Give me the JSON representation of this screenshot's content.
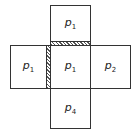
{
  "diagram": {
    "cells": {
      "top": {
        "base": "p",
        "sub": "1"
      },
      "left": {
        "base": "p",
        "sub": "1"
      },
      "center": {
        "base": "p",
        "sub": "1"
      },
      "right": {
        "base": "p",
        "sub": "2"
      },
      "bottom": {
        "base": "p",
        "sub": "4"
      }
    },
    "hatched_boundaries": [
      "top-center",
      "left-center"
    ],
    "colors": {
      "stroke": "#333333",
      "hatch": "#555555",
      "background": "#ffffff"
    }
  }
}
